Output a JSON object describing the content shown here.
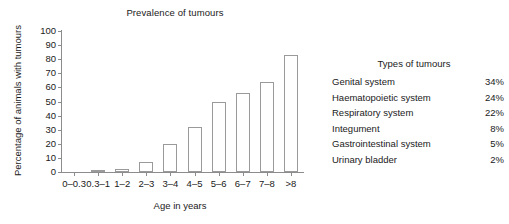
{
  "chart_data": {
    "type": "bar",
    "title": "Prevalence of tumours",
    "xlabel": "Age in years",
    "ylabel": "Percentage of animals with tumours",
    "categories": [
      "0–0.3",
      "0.3–1",
      "1–2",
      "2–3",
      "3–4",
      "4–5",
      "5–6",
      "6–7",
      "7–8",
      ">8"
    ],
    "values": [
      0,
      1,
      2,
      7,
      20,
      32,
      50,
      56,
      64,
      83
    ],
    "ylim": [
      0,
      100
    ],
    "yticks": [
      0,
      10,
      20,
      30,
      40,
      50,
      60,
      70,
      80,
      90,
      100
    ],
    "ytick_labels": [
      "0",
      "10",
      "20",
      "30",
      "40",
      "50",
      "60",
      "70",
      "80",
      "90",
      "100"
    ],
    "grid": false,
    "legend": "none",
    "bar_fill": "#ffffff",
    "bar_edge": "#9a9a9a",
    "axis_color": "#8c8c8c"
  },
  "legend_panel": {
    "title": "Types of tumours",
    "rows": [
      {
        "name": "Genital system",
        "value": "34%"
      },
      {
        "name": "Haematopoietic system",
        "value": "24%"
      },
      {
        "name": "Respiratory system",
        "value": "22%"
      },
      {
        "name": "Integument",
        "value": "8%"
      },
      {
        "name": "Gastrointestinal system",
        "value": "5%"
      },
      {
        "name": "Urinary bladder",
        "value": "2%"
      }
    ]
  }
}
